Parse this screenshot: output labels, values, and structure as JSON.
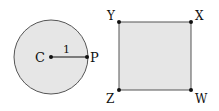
{
  "figure": {
    "circle": {
      "center_label": "C",
      "point_label": "P",
      "radius_label": "1",
      "fill": "#e6e6e6",
      "stroke": "#555555"
    },
    "square": {
      "vertices": [
        {
          "label": "Y",
          "position": "top-left"
        },
        {
          "label": "X",
          "position": "top-right"
        },
        {
          "label": "Z",
          "position": "bottom-left"
        },
        {
          "label": "W",
          "position": "bottom-right"
        }
      ],
      "fill": "#e6e6e6",
      "stroke": "#555555"
    }
  }
}
